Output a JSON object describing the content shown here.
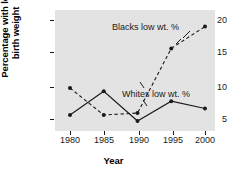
{
  "chart_data": {
    "type": "line",
    "title": "",
    "xlabel": "Year",
    "ylabel": "Percentage with low birth weight",
    "ylabel_line1": "Percentage with low",
    "ylabel_line2": "birth weight",
    "x": [
      1980,
      1985,
      1990,
      1995,
      2000
    ],
    "xtick_labels": [
      "1980",
      "1985",
      "1990",
      "1995",
      "2000"
    ],
    "ytick_labels": [
      "5",
      "10",
      "15",
      "20"
    ],
    "yticks": [
      5,
      10,
      15,
      20
    ],
    "xlim": [
      1978,
      2002
    ],
    "ylim": [
      3.2,
      22.0
    ],
    "grid": false,
    "legend_position": "inline-annotations",
    "panel_color": "#e3e3e3",
    "series": [
      {
        "name": "Blacks low wt. %",
        "annotation": "Blacks low wt. %",
        "style": "dashed",
        "color": "#1a1a1a",
        "marker": "filled-circle",
        "values": [
          9.7,
          5.6,
          5.9,
          15.7,
          19.0
        ]
      },
      {
        "name": "Whites low wt. %",
        "annotation": "Whites low wt. %",
        "style": "solid",
        "color": "#1a1a1a",
        "marker": "filled-circle",
        "values": [
          5.6,
          9.2,
          4.7,
          7.7,
          6.6
        ]
      }
    ]
  }
}
